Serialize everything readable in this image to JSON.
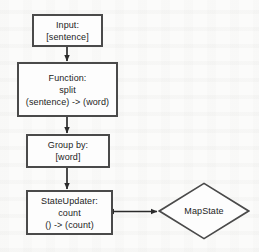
{
  "diagram": {
    "type": "flowchart",
    "colors": {
      "background": "#fbfbfa",
      "node_fill": "#fdfdfd",
      "node_border": "#4a4a4a",
      "edge": "#2b2b2b",
      "text": "#1c1c1c"
    },
    "nodes": [
      {
        "id": "input",
        "shape": "rectangle",
        "lines": [
          "Input:",
          "[sentence]"
        ],
        "x": 32,
        "y": 14,
        "w": 71,
        "h": 33
      },
      {
        "id": "function",
        "shape": "rectangle",
        "lines": [
          "Function:",
          "split",
          "(sentence) -> (word)"
        ],
        "x": 17,
        "y": 62,
        "w": 101,
        "h": 55
      },
      {
        "id": "groupby",
        "shape": "rectangle",
        "lines": [
          "Group by:",
          "[word]"
        ],
        "x": 26,
        "y": 134,
        "w": 84,
        "h": 34
      },
      {
        "id": "stateupdater",
        "shape": "rectangle",
        "lines": [
          "StateUpdater:",
          "count",
          "() -> (count)"
        ],
        "x": 26,
        "y": 190,
        "w": 87,
        "h": 45
      },
      {
        "id": "mapstate",
        "shape": "diamond",
        "lines": [
          "MapState"
        ],
        "x": 158,
        "y": 182,
        "w": 92,
        "h": 58
      }
    ],
    "edges": [
      {
        "id": "input-to-function",
        "from": "input",
        "to": "function",
        "arrows": "single",
        "direction": "down"
      },
      {
        "id": "function-to-groupby",
        "from": "function",
        "to": "groupby",
        "arrows": "single",
        "direction": "down"
      },
      {
        "id": "groupby-to-stateupdater",
        "from": "groupby",
        "to": "stateupdater",
        "arrows": "single",
        "direction": "down"
      },
      {
        "id": "stateupdater-to-mapstate",
        "from": "stateupdater",
        "to": "mapstate",
        "arrows": "double",
        "direction": "horizontal"
      }
    ]
  }
}
